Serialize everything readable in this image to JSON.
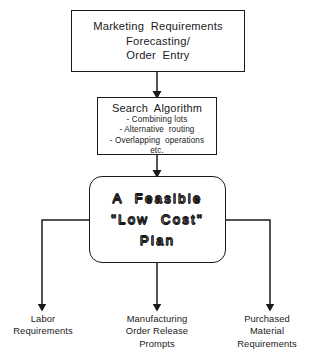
{
  "diagram": {
    "line_color": "#1a1a1a",
    "background": "#ffffff"
  },
  "nodes": {
    "marketing": {
      "shape": "rectangle",
      "lines": [
        "Marketing  Requirements",
        "Forecasting/",
        "Order  Entry"
      ]
    },
    "search": {
      "shape": "rectangle",
      "title": "Search  Algorithm",
      "bullets": [
        "- Combining lots",
        "- Alternative  routing",
        "- Overlapping  operations",
        "etc."
      ]
    },
    "plan": {
      "shape": "rounded-rectangle",
      "lines": [
        "A  Feasible",
        "\"Low  Cost\"",
        "Plan"
      ]
    }
  },
  "outputs": [
    {
      "id": "labor",
      "lines": [
        "Labor",
        "Requirements"
      ]
    },
    {
      "id": "manufacturing",
      "lines": [
        "Manufacturing",
        "Order Release",
        "Prompts"
      ]
    },
    {
      "id": "purchased",
      "lines": [
        "Purchased",
        "Material",
        "Requirements"
      ]
    }
  ],
  "connectors": {
    "marketing_to_search": "arrow-down",
    "search_to_plan": "arrow-down",
    "plan_to_labor": "elbow-left-down-arrow",
    "plan_to_manufacturing": "arrow-down",
    "plan_to_purchased": "elbow-right-down-arrow"
  }
}
